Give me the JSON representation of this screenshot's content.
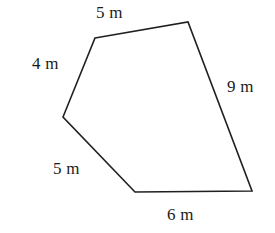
{
  "figure": {
    "type": "polygon-diagram",
    "shape": "pentagon",
    "unit": "m",
    "background_color": "#ffffff",
    "stroke_color": "#231f20",
    "stroke_width": 1.6,
    "fill_color": "none",
    "width": 275,
    "height": 233,
    "vertices": [
      {
        "name": "top-left",
        "x": 95,
        "y": 38
      },
      {
        "name": "top-right",
        "x": 188,
        "y": 22
      },
      {
        "name": "bottom-right",
        "x": 252,
        "y": 191
      },
      {
        "name": "bottom-left",
        "x": 135,
        "y": 192
      },
      {
        "name": "left",
        "x": 63,
        "y": 117
      }
    ],
    "sides": [
      {
        "id": "top",
        "label": "5 m",
        "value": 5,
        "from": "top-left",
        "to": "top-right"
      },
      {
        "id": "right",
        "label": "9 m",
        "value": 9,
        "from": "top-right",
        "to": "bottom-right"
      },
      {
        "id": "bottom",
        "label": "6 m",
        "value": 6,
        "from": "bottom-right",
        "to": "bottom-left"
      },
      {
        "id": "lower-left",
        "label": "5 m",
        "value": 5,
        "from": "bottom-left",
        "to": "left"
      },
      {
        "id": "upper-left",
        "label": "4 m",
        "value": 4,
        "from": "left",
        "to": "top-left"
      }
    ],
    "labels": {
      "top": "5 m",
      "upper_left": "4 m",
      "right": "9 m",
      "lower_left": "5 m",
      "bottom": "6 m"
    }
  }
}
